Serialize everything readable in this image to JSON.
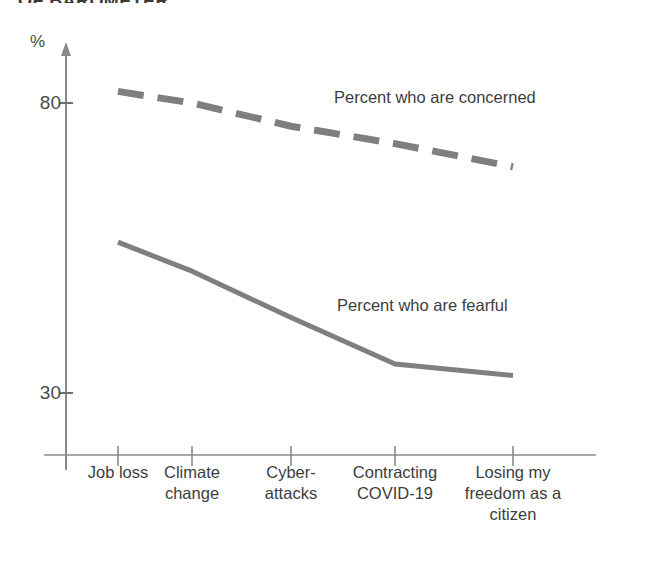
{
  "heading": {
    "clipped_text": "OF BAROMETER"
  },
  "axes": {
    "y_unit_label": "%",
    "y_ticks": [
      "80",
      "30"
    ],
    "x_categories": [
      "Job loss",
      "Climate\nchange",
      "Cyber-\nattacks",
      "Contracting\nCOVID-19",
      "Losing my\nfreedom as a\ncitizen"
    ]
  },
  "series_labels": {
    "concerned": "Percent who are concerned",
    "fearful": "Percent who are fearful"
  },
  "colors": {
    "line": "#7f7f7f",
    "axis": "#808080",
    "text": "#3d3d3d"
  },
  "chart_data": {
    "type": "line",
    "title": "OF BAROMETER",
    "xlabel": "",
    "ylabel": "%",
    "ylim": [
      20,
      90
    ],
    "yticks": [
      30,
      80
    ],
    "grid": false,
    "legend": "inline-annotations",
    "categories": [
      "Job loss",
      "Climate change",
      "Cyber-attacks",
      "Contracting COVID-19",
      "Losing my freedom as a citizen"
    ],
    "series": [
      {
        "name": "Percent who are concerned",
        "style": "dashed",
        "color": "#7f7f7f",
        "values": [
          82,
          80,
          76,
          73,
          69
        ]
      },
      {
        "name": "Percent who are fearful",
        "style": "solid",
        "color": "#7f7f7f",
        "values": [
          56,
          51,
          43,
          35,
          33
        ]
      }
    ]
  }
}
